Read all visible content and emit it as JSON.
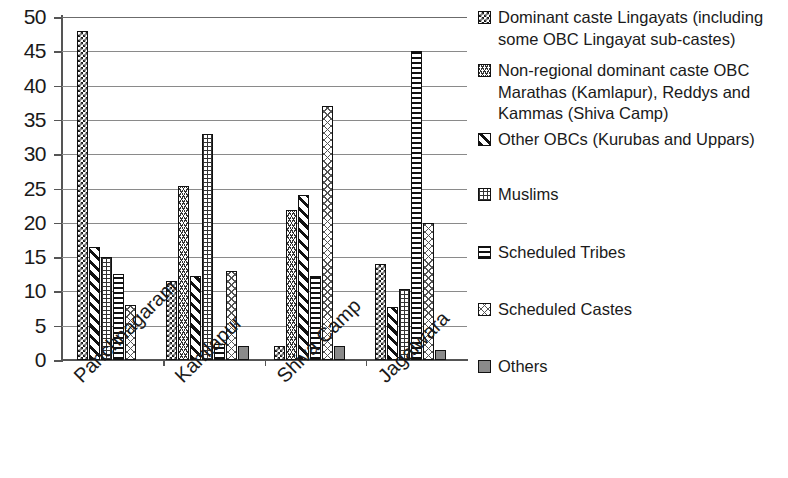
{
  "chart_data": {
    "type": "bar",
    "title": "",
    "subtitle": "",
    "xlabel": "",
    "ylabel": "",
    "ylim": [
      0,
      50
    ],
    "ytick_step": 5,
    "yticks": [
      "0",
      "5",
      "10",
      "15",
      "20",
      "25",
      "30",
      "35",
      "40",
      "45",
      "50"
    ],
    "grid": true,
    "grid_axis": "y",
    "legend_position": "right",
    "categories": [
      "Panchnagaram",
      "Kamlapur",
      "Shiva Camp",
      "Jagalwara"
    ],
    "series": [
      {
        "name": "Dominant caste Lingayats (including some OBC Lingayat sub-castes)",
        "pattern": "checkerboard",
        "values": [
          48,
          11.5,
          2,
          14
        ]
      },
      {
        "name": "Non-regional dominant caste OBC Marathas (Kamlapur), Reddys and Kammas  (Shiva Camp)",
        "pattern": "wavy-crosshatch",
        "values": [
          null,
          25.3,
          21.8,
          null
        ]
      },
      {
        "name": "Other OBCs (Kurubas and Uppars)",
        "pattern": "diagonal-stripes",
        "values": [
          16.5,
          12.2,
          24,
          7.8
        ]
      },
      {
        "name": "Muslims",
        "pattern": "fine-grid",
        "values": [
          15,
          33,
          null,
          10.3
        ]
      },
      {
        "name": "Scheduled Tribes",
        "pattern": "horizontal-lines",
        "values": [
          12.5,
          2.3,
          12.3,
          45
        ]
      },
      {
        "name": "Scheduled Castes",
        "pattern": "light-crosshatch",
        "values": [
          8,
          13,
          37,
          20
        ]
      },
      {
        "name": "Others",
        "pattern": "solid-gray",
        "values": [
          null,
          2,
          2,
          1.4
        ]
      }
    ]
  }
}
